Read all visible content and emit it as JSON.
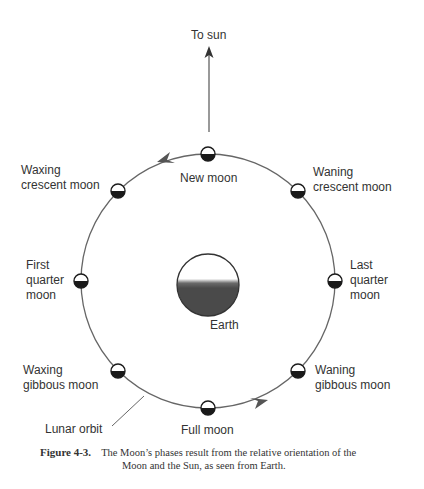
{
  "diagram": {
    "sun_label": "To sun",
    "earth_label": "Earth",
    "orbit_label": "Lunar orbit",
    "phases": [
      {
        "id": "new",
        "label": "New moon"
      },
      {
        "id": "waning-crescent",
        "label": "Waning\ncrescent moon"
      },
      {
        "id": "last-quarter",
        "label": "Last\nquarter\nmoon"
      },
      {
        "id": "waning-gibbous",
        "label": "Waning\ngibbous moon"
      },
      {
        "id": "full",
        "label": "Full moon"
      },
      {
        "id": "waxing-gibbous",
        "label": "Waxing\ngibbous moon"
      },
      {
        "id": "first-quarter",
        "label": "First\nquarter\nmoon"
      },
      {
        "id": "waxing-crescent",
        "label": "Waxing\ncrescent moon"
      }
    ],
    "colors": {
      "line": "#555555",
      "moon_dark": "#1a1a1a",
      "earth_dark": "#4a4a4a",
      "text": "#333333"
    }
  },
  "caption": {
    "figure_label": "Figure 4-3.",
    "line1": "The Moon’s phases result from the relative orientation of the",
    "line2": "Moon and the Sun, as seen from Earth."
  }
}
